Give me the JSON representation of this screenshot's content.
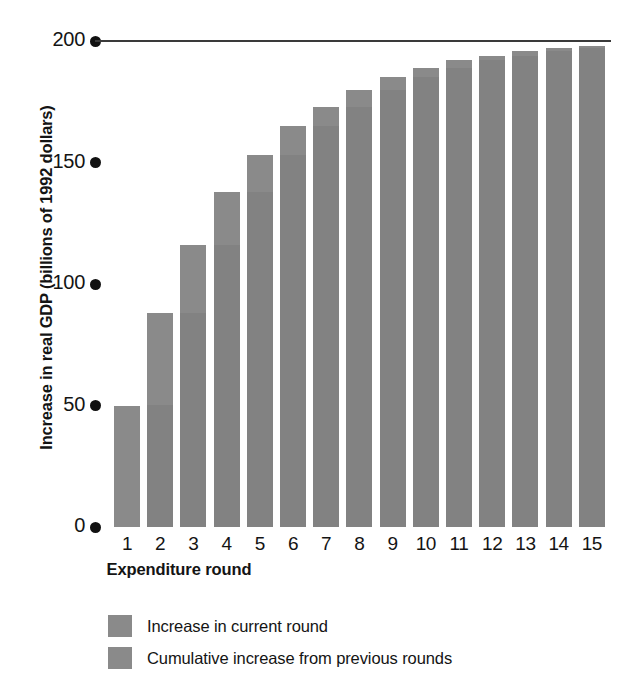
{
  "chart_data": {
    "type": "bar",
    "title": "",
    "subtitle": "",
    "xlabel": "Expenditure round",
    "ylabel": "Increase in real GDP (billions of 1992 dollars)",
    "categories": [
      "1",
      "2",
      "3",
      "4",
      "5",
      "6",
      "7",
      "8",
      "9",
      "10",
      "11",
      "12",
      "13",
      "14",
      "15"
    ],
    "values": [
      50,
      88,
      116,
      138,
      153,
      165,
      173,
      180,
      185,
      189,
      192,
      194,
      196,
      197,
      198
    ],
    "series": [
      {
        "name": "Cumulative increase from previous rounds",
        "values": [
          0,
          50,
          88,
          116,
          138,
          153,
          165,
          173,
          180,
          185,
          189,
          192,
          194,
          196,
          197
        ]
      },
      {
        "name": "Increase in current round",
        "values": [
          50,
          38,
          28,
          22,
          15,
          12,
          8,
          7,
          5,
          4,
          3,
          2,
          2,
          1,
          1
        ]
      }
    ],
    "ylim": [
      0,
      200
    ],
    "yticks": [
      0,
      50,
      100,
      150,
      200
    ],
    "ytick_labels": [
      "0",
      "50",
      "100",
      "150",
      "200"
    ],
    "grid": false,
    "legend_position": "bottom-left",
    "reference_line": {
      "value": 200,
      "label": "200"
    },
    "bar_color": "#828282",
    "axis_color": "#111111",
    "text_color": "#141414"
  },
  "axes": {
    "y_title": "Increase in real GDP (billions of 1992 dollars)",
    "x_title": "Expenditure round"
  },
  "legend": {
    "items": [
      {
        "label": "Increase in current round",
        "color": "#8a8a8a"
      },
      {
        "label": "Cumulative increase from previous rounds",
        "color": "#8a8a8a"
      }
    ]
  }
}
